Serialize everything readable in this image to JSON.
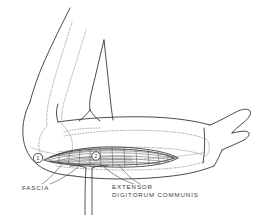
{
  "figure": {
    "type": "anatomical-line-drawing",
    "background_color": "#ffffff",
    "ink_color": "#2b2b2b",
    "light_ink_color": "#9a9a9a",
    "width": 264,
    "height": 215
  },
  "labels": {
    "fascia": "FASCIA",
    "extensor_line1": "EXTENSOR",
    "extensor_line2": "DIGITORUM  COMMUNIS"
  },
  "markers": [
    {
      "id": "marker-1",
      "text": "1",
      "shape": "circle",
      "x": 38,
      "y": 158
    },
    {
      "id": "marker-2",
      "text": "2",
      "shape": "circle",
      "x": 96,
      "y": 156
    }
  ],
  "structures": [
    {
      "name": "upper-arm-outline",
      "style": "solid"
    },
    {
      "name": "forearm-outline",
      "style": "solid"
    },
    {
      "name": "hand-outline",
      "style": "solid"
    },
    {
      "name": "thumb-outline",
      "style": "solid"
    },
    {
      "name": "olecranon-elbow-outline",
      "style": "solid"
    },
    {
      "name": "humerus-bone",
      "style": "dotted"
    },
    {
      "name": "ulna-bone",
      "style": "dotted"
    },
    {
      "name": "radius-bone",
      "style": "dotted"
    },
    {
      "name": "surgical-incision",
      "style": "solid"
    },
    {
      "name": "extensor-digitorum-communis-muscle",
      "style": "hatched"
    },
    {
      "name": "fascia-flap",
      "style": "solid"
    },
    {
      "name": "retractor-handle",
      "style": "solid"
    },
    {
      "name": "leader-line-fascia",
      "style": "solid"
    },
    {
      "name": "leader-line-extensor",
      "style": "solid"
    }
  ]
}
